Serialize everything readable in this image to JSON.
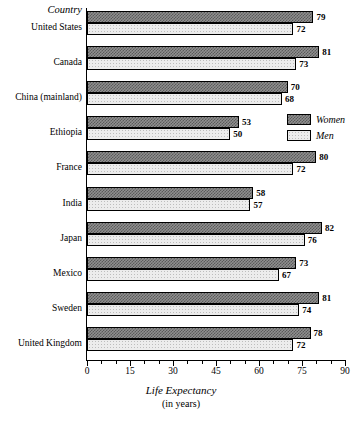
{
  "chart_data": {
    "type": "bar",
    "orientation": "horizontal",
    "title": "",
    "xlabel": "Life Expectancy",
    "xlabel_sub": "(in years)",
    "ylabel": "Country",
    "categories": [
      "United States",
      "Canada",
      "China (mainland)",
      "Ethiopia",
      "France",
      "India",
      "Japan",
      "Mexico",
      "Sweden",
      "United Kingdom"
    ],
    "series": [
      {
        "name": "Women",
        "values": [
          79,
          81,
          70,
          53,
          80,
          58,
          82,
          73,
          81,
          78
        ]
      },
      {
        "name": "Men",
        "values": [
          72,
          73,
          68,
          50,
          72,
          57,
          76,
          67,
          74,
          72
        ]
      }
    ],
    "xlim": [
      0,
      90
    ],
    "xticks": [
      0,
      15,
      30,
      45,
      60,
      75,
      90
    ],
    "xtick_labels": [
      "0",
      "15",
      "30",
      "45",
      "60",
      "75",
      "90"
    ],
    "minor_tick_step": 5,
    "grid": false,
    "legend": [
      "Women",
      "Men"
    ],
    "legend_position": "inside-right-upper",
    "value_labels": true
  },
  "legend": {
    "items": [
      {
        "label": "Women",
        "swatch": "women-swatch"
      },
      {
        "label": "Men",
        "swatch": "men-swatch"
      }
    ]
  },
  "axis": {
    "y_header": "Country",
    "x_title": "Life Expectancy",
    "x_title_sub": "(in years)"
  },
  "colors": {
    "women_fill": "#8f8f8f",
    "women_pattern": "#5a5a5a",
    "men_fill": "#ececec",
    "men_pattern": "#bdbdbd",
    "outline": "#000000",
    "background": "#ffffff"
  }
}
